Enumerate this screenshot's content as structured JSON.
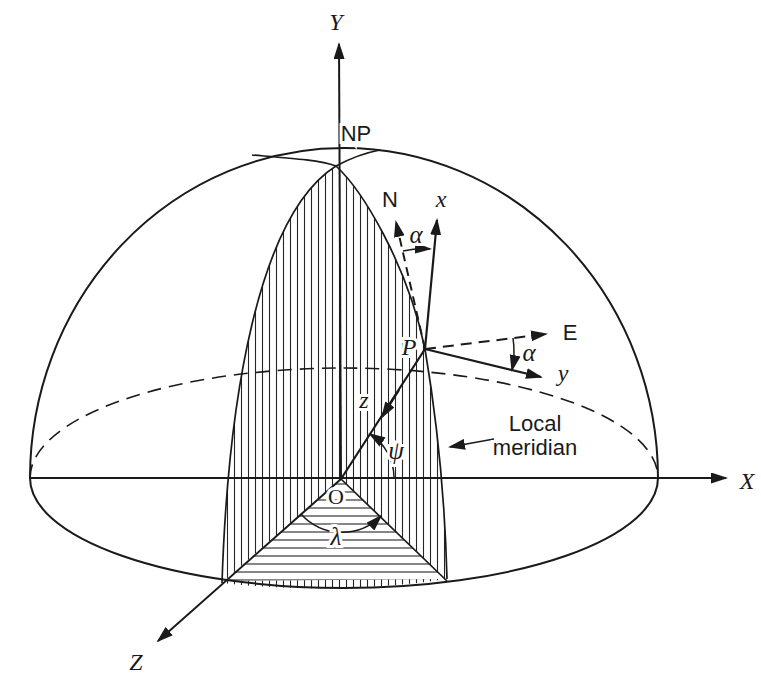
{
  "figure": {
    "title_semantic": "Hemisphere diagram of ECEF and local (ENU) coordinate frames",
    "background": "#ffffff",
    "ink": "#1a1a1a",
    "labels": {
      "axis_x_global": "X",
      "axis_y_global": "Y",
      "axis_z_global": "Z",
      "north_pole": "NP",
      "origin": "O",
      "point_p": "P",
      "local_north": "N",
      "local_east": "E",
      "local_axis_x": "x",
      "local_axis_y": "y",
      "local_axis_z": "z",
      "azimuth_angle_top": "α",
      "azimuth_angle_right": "α",
      "latitude_angle": "ψ",
      "longitude_angle": "λ",
      "annotation_line1": "Local",
      "annotation_line2": "meridian"
    }
  }
}
